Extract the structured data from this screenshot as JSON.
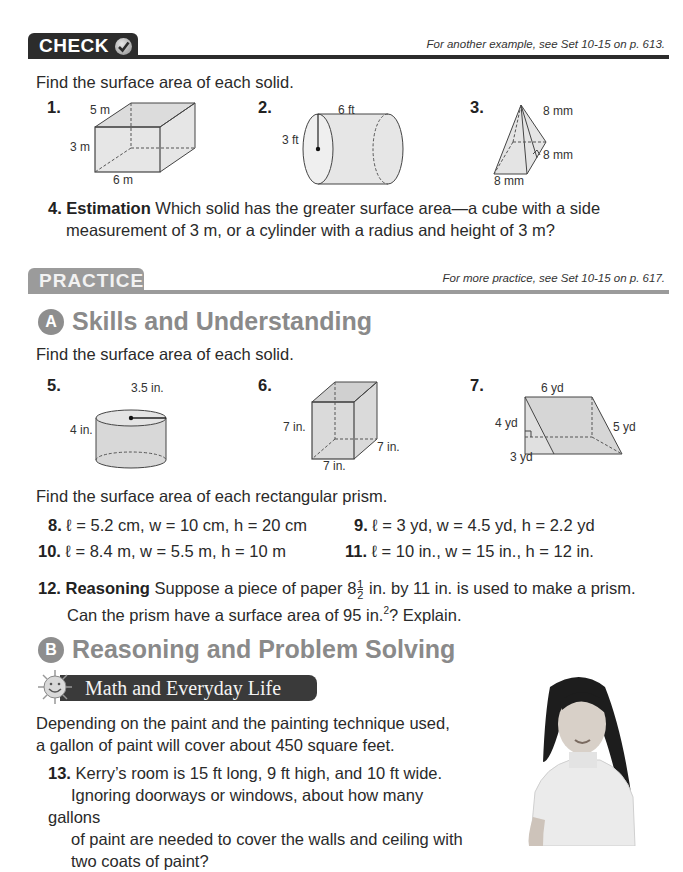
{
  "check_section": {
    "tab_label": "CHECK",
    "icon": "checkmark-circle-icon",
    "reference_note": "For another example, see Set 10-15 on p. 613.",
    "instruction": "Find the surface area of each solid.",
    "figures": [
      {
        "number": "1.",
        "shape": "rectangular-prism",
        "labels": [
          "5 m",
          "3 m",
          "6 m"
        ]
      },
      {
        "number": "2.",
        "shape": "cylinder",
        "labels": [
          "6 ft",
          "3 ft"
        ]
      },
      {
        "number": "3.",
        "shape": "square-pyramid",
        "labels": [
          "8 mm",
          "8 mm",
          "8 mm"
        ]
      }
    ],
    "q4": {
      "number": "4.",
      "title": "Estimation",
      "line1": "Which solid has the greater surface area—a cube with a side",
      "line2": "measurement of 3 m, or a cylinder with a radius and height of 3 m?"
    }
  },
  "practice_section": {
    "tab_label": "PRACTICE",
    "reference_note": "For more practice, see Set 10-15 on p. 617.",
    "section_a": {
      "badge": "A",
      "title": "Skills and Understanding",
      "instruction": "Find the surface area of each solid.",
      "figures": [
        {
          "number": "5.",
          "shape": "cylinder",
          "labels": [
            "3.5 in.",
            "4 in."
          ]
        },
        {
          "number": "6.",
          "shape": "cube",
          "labels": [
            "7 in.",
            "7 in.",
            "7 in."
          ]
        },
        {
          "number": "7.",
          "shape": "triangular-prism",
          "labels": [
            "6 yd",
            "4 yd",
            "5 yd",
            "3 yd"
          ]
        }
      ],
      "instruction2": "Find the surface area of each rectangular prism.",
      "problems": [
        {
          "number": "8.",
          "text": "ℓ = 5.2 cm, w = 10 cm, h = 20 cm"
        },
        {
          "number": "9.",
          "text": "ℓ = 3 yd, w = 4.5 yd, h = 2.2 yd"
        },
        {
          "number": "10.",
          "text": "ℓ = 8.4 m, w = 5.5 m, h = 10 m"
        },
        {
          "number": "11.",
          "text": "ℓ = 10 in., w = 15 in., h = 12 in."
        }
      ],
      "q12": {
        "number": "12.",
        "title": "Reasoning",
        "line1_a": "Suppose a piece of paper 8",
        "frac_num": "1",
        "frac_den": "2",
        "line1_b": " in. by 11 in. is used to make a prism.",
        "line2_a": "Can the prism have a surface area of 95 in.",
        "line2_sup": "2",
        "line2_b": "? Explain."
      }
    },
    "section_b": {
      "badge": "B",
      "title": "Reasoning and Problem Solving",
      "banner": "Math and Everyday Life",
      "banner_icon": "smiling-sun-icon",
      "intro_line1": "Depending on the paint and the painting technique used,",
      "intro_line2": "a gallon of paint will cover about 450 square feet.",
      "q13": {
        "number": "13.",
        "lines": [
          "Kerry’s room is 15 ft long, 9 ft high, and 10 ft wide.",
          "Ignoring doorways or windows, about how many gallons",
          "of paint are needed to cover the walls and ceiling with",
          "two coats of paint?"
        ]
      },
      "photo": "girl-in-white-sweater-photo"
    }
  }
}
